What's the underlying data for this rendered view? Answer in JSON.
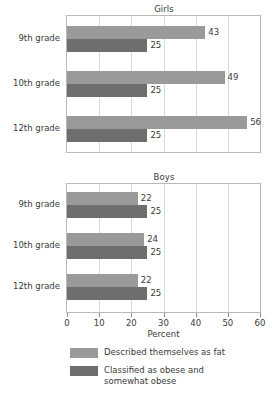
{
  "chart_data": {
    "type": "bar",
    "orientation": "horizontal",
    "title": "",
    "xlabel": "Percent",
    "ylabel": "",
    "xlim": [
      0,
      60
    ],
    "xticks": [
      0,
      10,
      20,
      30,
      40,
      50,
      60
    ],
    "xtick_labels": [
      "0",
      "10",
      "20",
      "30",
      "40",
      "50",
      "60"
    ],
    "grid": true,
    "legend_position": "bottom",
    "categories": [
      "9th grade",
      "10th grade",
      "12th grade"
    ],
    "series": [
      {
        "name": "Described themselves as fat",
        "color": "#9a9a9a"
      },
      {
        "name": "Classified as obese and somewhat obese",
        "color": "#6e6e6e"
      }
    ],
    "panels": [
      {
        "title": "Girls",
        "categories": [
          "9th grade",
          "10th grade",
          "12th grade"
        ],
        "series": [
          {
            "name": "Described themselves as fat",
            "values": [
              43,
              49,
              56
            ]
          },
          {
            "name": "Classified as obese and somewhat obese",
            "values": [
              25,
              25,
              25
            ]
          }
        ]
      },
      {
        "title": "Boys",
        "categories": [
          "9th grade",
          "10th grade",
          "12th grade"
        ],
        "series": [
          {
            "name": "Described themselves as fat",
            "values": [
              22,
              24,
              22
            ]
          },
          {
            "name": "Classified as obese and somewhat obese",
            "values": [
              25,
              25,
              25
            ]
          }
        ]
      }
    ]
  },
  "panels": {
    "girls": {
      "title": "Girls",
      "groups": [
        {
          "label": "9th grade",
          "s1_value": "43",
          "s2_value": "25"
        },
        {
          "label": "10th grade",
          "s1_value": "49",
          "s2_value": "25"
        },
        {
          "label": "12th grade",
          "s1_value": "56",
          "s2_value": "25"
        }
      ]
    },
    "boys": {
      "title": "Boys",
      "groups": [
        {
          "label": "9th grade",
          "s1_value": "22",
          "s2_value": "25"
        },
        {
          "label": "10th grade",
          "s1_value": "24",
          "s2_value": "25"
        },
        {
          "label": "12th grade",
          "s1_value": "22",
          "s2_value": "25"
        }
      ]
    }
  },
  "axis": {
    "title": "Percent",
    "ticks": [
      "0",
      "10",
      "20",
      "30",
      "40",
      "50",
      "60"
    ]
  },
  "legend": {
    "entries": [
      {
        "line1": "Described themselves as fat",
        "line2": ""
      },
      {
        "line1": "Classified as obese and",
        "line2": "somewhat obese"
      }
    ]
  },
  "colors": {
    "series1": "#9a9a9a",
    "series2": "#6e6e6e",
    "axis": "#b9b9b9",
    "grid": "#d9d9d9",
    "text": "#3a3a3a"
  }
}
